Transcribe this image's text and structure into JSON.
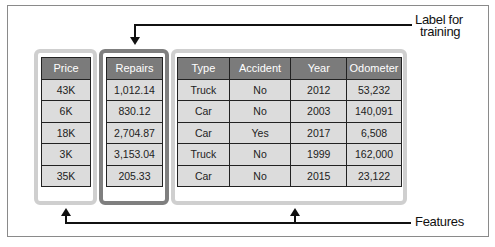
{
  "diagram": {
    "label_callout": "Label for training",
    "label_callout_lines": [
      "Label for",
      "training"
    ],
    "features_callout": "Features",
    "colors": {
      "header_bg": "#7b7b7b",
      "cell_bg": "#dcdcdc",
      "feature_group_border": "#cfcfcf",
      "label_group_border": "#7f7f7f",
      "arrow": "#111111"
    }
  },
  "table": {
    "columns": [
      "Price",
      "Repairs",
      "Type",
      "Accident",
      "Year",
      "Odometer"
    ],
    "rows": [
      [
        "43K",
        "1,012.14",
        "Truck",
        "No",
        "2012",
        "53,232"
      ],
      [
        "6K",
        "830.12",
        "Car",
        "No",
        "2003",
        "140,091"
      ],
      [
        "18K",
        "2,704.87",
        "Car",
        "Yes",
        "2017",
        "6,508"
      ],
      [
        "3K",
        "3,153.04",
        "Truck",
        "No",
        "1999",
        "162,000"
      ],
      [
        "35K",
        "205.33",
        "Car",
        "No",
        "2015",
        "23,122"
      ]
    ]
  }
}
